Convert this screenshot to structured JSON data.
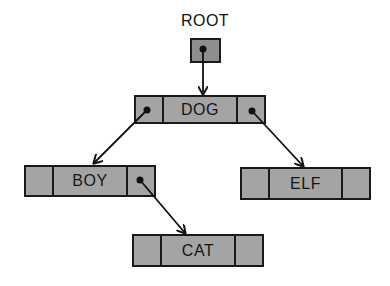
{
  "diagram": {
    "type": "binary-search-tree",
    "root_label": "ROOT",
    "nodes": [
      {
        "id": "dog",
        "key": "DOG",
        "left": "boy",
        "right": "elf"
      },
      {
        "id": "boy",
        "key": "BOY",
        "left": null,
        "right": "cat"
      },
      {
        "id": "elf",
        "key": "ELF",
        "left": null,
        "right": null
      },
      {
        "id": "cat",
        "key": "CAT",
        "left": null,
        "right": null
      }
    ],
    "edges": [
      {
        "from": "ROOT",
        "to": "DOG"
      },
      {
        "from": "DOG",
        "to": "BOY",
        "side": "left"
      },
      {
        "from": "DOG",
        "to": "ELF",
        "side": "right"
      },
      {
        "from": "BOY",
        "to": "CAT",
        "side": "right"
      }
    ],
    "colors": {
      "fill": "#a4a4a4",
      "stroke": "#1a1a1a",
      "background": "#ffffff"
    }
  }
}
